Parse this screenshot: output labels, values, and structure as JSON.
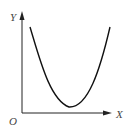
{
  "diagram": {
    "type": "u-shaped curve on axes",
    "axes": {
      "y_label": "Y",
      "x_label": "X",
      "origin_label": "O"
    },
    "curve": {
      "shape": "parabola-like U",
      "description": "Curve descends from upper-left, reaches a minimum above the x-axis, then rises to upper-right"
    },
    "colors": {
      "axis": "#222222",
      "curve": "#111111",
      "label": "#444444"
    }
  }
}
